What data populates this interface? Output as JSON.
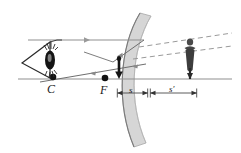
{
  "figure": {
    "kind": "optics-ray-diagram",
    "background_color": "#ffffff"
  },
  "colors": {
    "mirror_fill": "#d6d6d6",
    "mirror_edge": "#8a8a8a",
    "axis": "#8f8f8f",
    "ray": "#6e6e6e",
    "dashed_ray": "#9a9a9a",
    "object": "#1a1a1a",
    "image_figure": "#3a3a3a",
    "eye": "#1a1a1a",
    "text": "#1a1a1a",
    "dimension": "#4a4a4a"
  },
  "labels": {
    "center_of_curvature": "C",
    "focal_point": "F",
    "object_distance": "s",
    "image_distance": "s′"
  },
  "points": {
    "C": {
      "x": 53,
      "y": 77
    },
    "F": {
      "x": 105,
      "y": 78
    },
    "vertex": {
      "x": 147,
      "y": 79
    }
  },
  "elements": {
    "mirror": {
      "name": "concave-mirror",
      "shape": "curved-band"
    },
    "optical_axis": {
      "name": "optical-axis",
      "orientation": "horizontal"
    },
    "eye": {
      "name": "observer-eye",
      "position": "left"
    },
    "object_arrow": {
      "name": "object-arrow",
      "direction": "down"
    },
    "image_figure": {
      "name": "image-figure",
      "direction": "down",
      "enlarged": true
    },
    "rays": [
      {
        "name": "parallel-incident-ray",
        "style": "solid"
      },
      {
        "name": "reflected-ray-through-focus",
        "style": "solid"
      },
      {
        "name": "chief-ray-to-eye",
        "style": "solid"
      },
      {
        "name": "virtual-extension-upper",
        "style": "dashed"
      },
      {
        "name": "virtual-extension-lower",
        "style": "dashed"
      }
    ]
  },
  "dimensions": {
    "s": {
      "label": "s",
      "from_x": 148,
      "to_x": 117
    },
    "s_prime": {
      "label": "s′",
      "from_x": 150,
      "to_x": 197
    }
  }
}
